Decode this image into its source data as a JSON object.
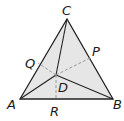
{
  "figure": {
    "type": "triangle-with-cevians",
    "colors": {
      "fill": "#e6e6e6",
      "edge": "#222222",
      "dashed": "#9a9a9a"
    },
    "vertices": {
      "A": {
        "label": "A",
        "x": 20,
        "y": 99
      },
      "B": {
        "label": "B",
        "x": 113,
        "y": 99
      },
      "C": {
        "label": "C",
        "x": 67,
        "y": 19
      }
    },
    "interior_point": {
      "label": "D",
      "x": 56,
      "y": 75
    },
    "side_points": {
      "P": {
        "label": "P",
        "x": 90,
        "y": 58,
        "side": "BC"
      },
      "Q": {
        "label": "Q",
        "x": 38,
        "y": 63,
        "side": "AC"
      },
      "R": {
        "label": "R",
        "x": 56,
        "y": 99,
        "side": "AB"
      }
    },
    "solid_segments": [
      "AB",
      "BC",
      "CA",
      "AD",
      "BD",
      "CD"
    ],
    "dashed_segments": [
      "DP",
      "DQ",
      "DR"
    ]
  }
}
